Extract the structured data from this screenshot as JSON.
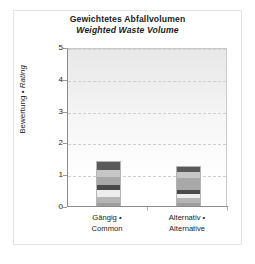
{
  "chart_data": {
    "type": "bar",
    "subtype": "stacked-bar",
    "title": "Gewichtetes Abfallvolumen",
    "subtitle": "Weighted Waste Volume",
    "xlabel": "",
    "ylabel": "Bewertung • Rating",
    "ylabel_parts": {
      "de": "Bewertung",
      "separator": "•",
      "en": "Rating"
    },
    "ylim": [
      0,
      5
    ],
    "yticks": [
      0,
      1,
      2,
      3,
      4,
      5
    ],
    "ytick_labels": [
      "0",
      "1",
      "2",
      "3",
      "4",
      "5"
    ],
    "grid": true,
    "grid_axis": "y",
    "grid_style": "dashed",
    "legend": "none",
    "categories": [
      "Gängig • Common",
      "Alternativ • Alternative"
    ],
    "category_parts": [
      {
        "de": "Gängig •",
        "en": "Common"
      },
      {
        "de": "Alternativ •",
        "en": "Alternative"
      }
    ],
    "totals": [
      1.45,
      1.28
    ],
    "series": [
      {
        "name": "segment-1",
        "color": "#9e9e9e",
        "values": [
          0.14,
          0.13
        ]
      },
      {
        "name": "segment-2",
        "color": "#b5b5b5",
        "values": [
          0.18,
          0.16
        ]
      },
      {
        "name": "segment-3",
        "color": "#ededed",
        "values": [
          0.2,
          0.12
        ]
      },
      {
        "name": "segment-4",
        "color": "#4a4a4a",
        "values": [
          0.17,
          0.14
        ]
      },
      {
        "name": "segment-5",
        "color": "#a8a8a8",
        "values": [
          0.27,
          0.35
        ]
      },
      {
        "name": "segment-6",
        "color": "#c6c6c6",
        "values": [
          0.22,
          0.2
        ]
      },
      {
        "name": "segment-7",
        "color": "#5a5a5a",
        "values": [
          0.27,
          0.18
        ]
      }
    ],
    "colors": {
      "axis": "#8c8c8c",
      "grid": "#cfcfcf",
      "text": "#1b1b1b",
      "frame": "#e2e2e2",
      "background": "#ffffff"
    }
  }
}
